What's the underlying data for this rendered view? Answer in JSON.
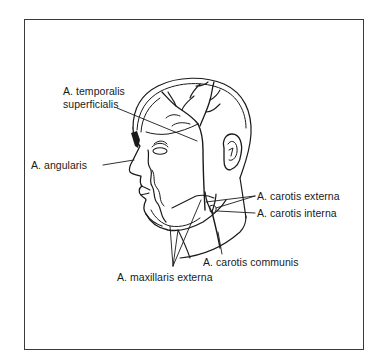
{
  "figure": {
    "labels": {
      "temporalis_line1": "A. temporalis",
      "temporalis_line2": "superficialis",
      "angularis": "A. angularis",
      "carotis_externa": "A. carotis externa",
      "carotis_interna": "A. carotis interna",
      "carotis_communis": "A. carotis communis",
      "maxillaris_externa": "A. maxillaris externa"
    },
    "colors": {
      "ink": "#1a1a1a",
      "frame": "#3a3a3a",
      "background": "#ffffff"
    }
  }
}
